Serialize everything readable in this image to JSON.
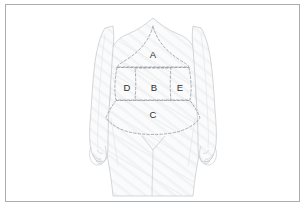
{
  "figure": {
    "frame_color": "#a9adb1",
    "background_color": "#ffffff",
    "body_outline_color": "#c2c6cb",
    "body_fill_color": "#fbfbfc",
    "dashed_line_color": "#9aa0a6",
    "label_color": "#2c2c2c"
  },
  "regions": [
    {
      "id": "region-a",
      "label": "A",
      "name": "upper-epigastric-region",
      "label_x": 153,
      "label_y": 55
    },
    {
      "id": "region-b",
      "label": "B",
      "name": "central-umbilical-region",
      "label_x": 154,
      "label_y": 88
    },
    {
      "id": "region-c",
      "label": "C",
      "name": "lower-hypogastric-region",
      "label_x": 153,
      "label_y": 115
    },
    {
      "id": "region-d",
      "label": "D",
      "name": "left-flank-region",
      "label_x": 127,
      "label_y": 88
    },
    {
      "id": "region-e",
      "label": "E",
      "name": "right-flank-region",
      "label_x": 180,
      "label_y": 88
    }
  ]
}
